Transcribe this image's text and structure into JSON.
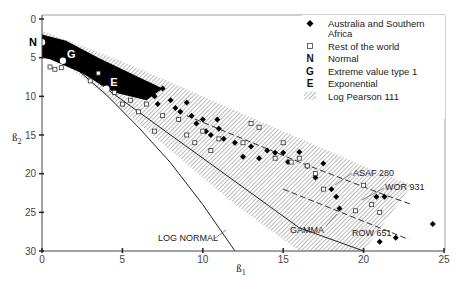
{
  "chart_data": {
    "type": "scatter",
    "title": "",
    "xlabel": "ß1",
    "ylabel": "ß2",
    "xlim": [
      0,
      25
    ],
    "ylim": [
      30,
      0
    ],
    "y_inverted": true,
    "x_ticks": [
      "0",
      "5",
      "10",
      "15",
      "20",
      "25"
    ],
    "y_ticks": [
      "0",
      "5",
      "10",
      "15",
      "20",
      "25",
      "30"
    ],
    "grid": false,
    "legend_position": "upper-right",
    "legend": [
      {
        "symbol": "filled-diamond",
        "label": "Australia and Southern Africa"
      },
      {
        "symbol": "open-square",
        "label": "Rest of the world"
      },
      {
        "symbol": "N",
        "label": "Normal"
      },
      {
        "symbol": "G",
        "label": "Extreme value type 1"
      },
      {
        "symbol": "E",
        "label": "Exponential"
      },
      {
        "symbol": "hatch",
        "label": "Log Pearson 111"
      }
    ],
    "annotations": [
      {
        "text": "ASAF 280",
        "x": 16.0,
        "y": 19.5
      },
      {
        "text": "WOR 931",
        "x": 18.5,
        "y": 21.5
      },
      {
        "text": "GAMMA",
        "x": 13.5,
        "y": 27.0
      },
      {
        "text": "ROW 651",
        "x": 17.5,
        "y": 28.0
      },
      {
        "text": "LOG NORMAL",
        "x": 7.0,
        "y": 28.0
      }
    ],
    "points_named": [
      {
        "label": "N",
        "x": 0.0,
        "y": 3.0
      },
      {
        "label": "G",
        "x": 1.3,
        "y": 5.4
      },
      {
        "label": "E",
        "x": 4.0,
        "y": 9.0
      }
    ],
    "curves": [
      {
        "name": "LOG NORMAL",
        "x": [
          0,
          2,
          4,
          6,
          8,
          10,
          12
        ],
        "y": [
          3.0,
          6.2,
          9.8,
          14.0,
          18.6,
          24.0,
          30.0
        ]
      },
      {
        "name": "GAMMA",
        "x": [
          0,
          4,
          8,
          12,
          16,
          20
        ],
        "y": [
          3.0,
          9.0,
          15.0,
          21.0,
          27.0,
          33.0
        ]
      },
      {
        "name": "Log Pearson 111 band upper",
        "x": [
          0,
          5,
          10,
          15,
          20,
          23
        ],
        "y": [
          1.5,
          5.5,
          10.0,
          14.5,
          19.0,
          21.5
        ]
      },
      {
        "name": "Log Pearson 111 band lower",
        "x": [
          0,
          4,
          8,
          12,
          16,
          20
        ],
        "y": [
          3.5,
          10.0,
          17.0,
          24.0,
          30.0,
          30.0
        ]
      }
    ],
    "series": [
      {
        "name": "Australia and Southern Africa",
        "marker": "filled-diamond",
        "x": [
          5.5,
          6.0,
          6.5,
          7.0,
          7.2,
          7.5,
          8.0,
          8.3,
          8.6,
          9.0,
          9.3,
          9.6,
          10.0,
          10.2,
          10.5,
          10.9,
          11.0,
          11.3,
          12.0,
          12.5,
          13.0,
          13.5,
          14.0,
          14.5,
          15.0,
          15.3,
          16.0,
          16.5,
          17.0,
          17.5,
          18.0,
          18.3,
          18.5,
          20.8,
          21.3,
          21.0,
          22.0,
          24.3
        ],
        "y": [
          8.5,
          9.5,
          8.8,
          10.0,
          11.0,
          9.0,
          10.5,
          11.5,
          12.0,
          10.8,
          12.5,
          13.5,
          13.0,
          14.5,
          15.0,
          13.0,
          14.2,
          15.5,
          16.0,
          17.8,
          16.5,
          18.0,
          17.0,
          17.3,
          17.3,
          18.5,
          17.2,
          19.0,
          20.5,
          18.7,
          22.0,
          23.0,
          24.5,
          23.0,
          23.0,
          28.8,
          28.3,
          26.5
        ]
      },
      {
        "name": "Rest of the world",
        "marker": "open-square",
        "x": [
          0.5,
          0.8,
          1.2,
          3.0,
          3.5,
          4.5,
          5.0,
          5.5,
          6.0,
          6.5,
          7.0,
          7.5,
          8.5,
          9.0,
          9.5,
          10.0,
          10.5,
          11.0,
          12.5,
          13.0,
          13.5,
          14.5,
          15.0,
          15.5,
          16.0,
          16.5,
          17.0,
          17.5,
          19.5,
          20.0,
          20.5,
          21.0
        ],
        "y": [
          6.2,
          6.5,
          6.3,
          8.0,
          7.0,
          9.5,
          11.0,
          10.5,
          12.0,
          11.0,
          14.5,
          12.5,
          13.0,
          15.0,
          16.0,
          14.5,
          17.0,
          15.5,
          16.0,
          13.5,
          14.0,
          18.0,
          16.0,
          18.5,
          18.0,
          19.0,
          20.0,
          22.0,
          24.8,
          21.5,
          24.0,
          25.0
        ]
      }
    ]
  }
}
